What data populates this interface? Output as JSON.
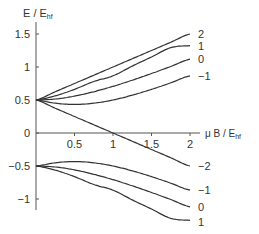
{
  "chart_data": {
    "type": "line",
    "title": "",
    "xlabel": "μ B / E_hf",
    "ylabel": "E / E_hf",
    "xlabel_parts": {
      "main": "μ B / E",
      "sub": "hf"
    },
    "ylabel_parts": {
      "main": "E / E",
      "sub": "hf"
    },
    "xlim": [
      0,
      2
    ],
    "ylim": [
      -1.3,
      1.6
    ],
    "xticks": [
      0.5,
      1,
      1.5,
      2
    ],
    "xtick_labels": [
      "0.5",
      "1",
      "1.5",
      "2"
    ],
    "yticks": [
      1.5,
      1,
      0.5,
      0,
      -0.5,
      -1
    ],
    "ytick_labels": [
      "1.5",
      "1",
      "0.5",
      "0",
      "−0.5",
      "−1"
    ],
    "grid": false,
    "legend": "inline labels at right end of each curve",
    "x": [
      0,
      0.25,
      0.5,
      0.75,
      1.0,
      1.25,
      1.5,
      1.75,
      2.0
    ],
    "series": [
      {
        "name": "2",
        "group": "upper",
        "values": [
          0.5,
          0.625,
          0.75,
          0.875,
          1.0,
          1.125,
          1.25,
          1.375,
          1.5
        ]
      },
      {
        "name": "1",
        "group": "upper",
        "values": [
          0.5,
          0.563,
          0.661,
          0.781,
          0.866,
          1.014,
          1.152,
          1.293,
          1.323
        ]
      },
      {
        "name": "0",
        "group": "upper",
        "values": [
          0.5,
          0.515,
          0.559,
          0.625,
          0.707,
          0.8,
          0.901,
          1.008,
          1.118
        ]
      },
      {
        "name": "−1",
        "group": "upper",
        "values": [
          0.5,
          0.451,
          0.433,
          0.451,
          0.5,
          0.573,
          0.661,
          0.76,
          0.866
        ]
      },
      {
        "name": "−2",
        "group": "upper",
        "values": [
          0.5,
          0.375,
          0.25,
          0.125,
          0.0,
          -0.125,
          -0.25,
          -0.375,
          -0.5
        ]
      },
      {
        "name": "−1",
        "group": "lower",
        "values": [
          -0.5,
          -0.451,
          -0.433,
          -0.451,
          -0.5,
          -0.573,
          -0.661,
          -0.76,
          -0.866
        ]
      },
      {
        "name": "0",
        "group": "lower",
        "values": [
          -0.5,
          -0.515,
          -0.559,
          -0.625,
          -0.707,
          -0.8,
          -0.901,
          -1.008,
          -1.118
        ]
      },
      {
        "name": "1",
        "group": "lower",
        "values": [
          -0.5,
          -0.563,
          -0.661,
          -0.781,
          -0.866,
          -1.014,
          -1.152,
          -1.293,
          -1.323
        ]
      }
    ],
    "curve_labels_right": [
      "2",
      "1",
      "0",
      "−1",
      "−2",
      "−1",
      "0",
      "1"
    ]
  }
}
